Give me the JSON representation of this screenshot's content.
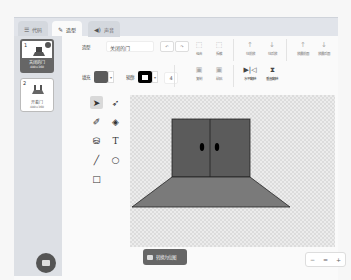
{
  "tabs": [
    {
      "label": "代码",
      "icon": "code-icon"
    },
    {
      "label": "造型",
      "icon": "brush-icon",
      "active": true
    },
    {
      "label": "声音",
      "icon": "speaker-icon"
    }
  ],
  "costumes": [
    {
      "num": "1",
      "name": "关闭的门",
      "size": "480×360",
      "selected": true
    },
    {
      "num": "2",
      "name": "开着门",
      "size": "480×360",
      "selected": false
    }
  ],
  "props": {
    "costume_label": "造型",
    "costume_name": "关闭的门",
    "fill_label": "填充",
    "fill_color": "#5b5b5b",
    "outline_label": "轮廓",
    "outline_color": "#000000",
    "outline_width": "4"
  },
  "toolbar": {
    "undo": "↶",
    "redo": "↷",
    "group": "组合",
    "ungroup": "拆散",
    "forward": "往前放",
    "backward": "往后放",
    "front": "放最前面",
    "back": "放最后面",
    "copy": "复制",
    "paste": "粘贴",
    "flip_h": "水平翻转",
    "flip_v": "垂直翻转"
  },
  "tools": [
    "select",
    "reshape",
    "brush",
    "eraser",
    "fill",
    "text",
    "line",
    "circle",
    "rect"
  ],
  "canvas": {
    "door_color": "#5b5b5b",
    "floor_color": "#7a7a7a"
  },
  "bottom": {
    "convert_label": "转换为位图",
    "zoom_out": "−",
    "zoom_reset": "=",
    "zoom_in": "+"
  }
}
